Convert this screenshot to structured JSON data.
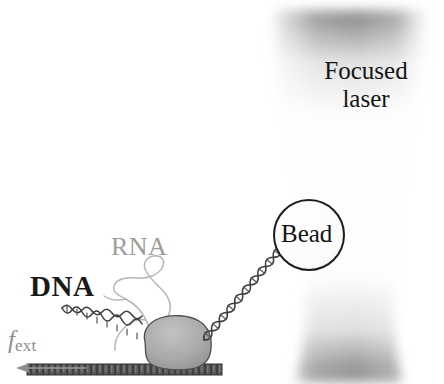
{
  "figure": {
    "width": 444,
    "height": 384,
    "background": "#ffffff"
  },
  "labels": {
    "dna": "DNA",
    "rna": "RNA",
    "bead": "Bead",
    "laser_line1": "Focused",
    "laser_line2": "laser",
    "force_symbol": "f",
    "force_subscript": "ext"
  },
  "colors": {
    "dna_label": "#1a1a1a",
    "rna_label": "#9d9d9d",
    "bead_label": "#141414",
    "laser_label": "#141414",
    "force_label": "#8e8e8e",
    "bead_fill": "#fdfdfd",
    "bead_stroke": "#1c1c1c",
    "laser_core": "#9a9a9a",
    "laser_edge": "#ffffff",
    "enzyme_fill": "#a8a8a8",
    "enzyme_stroke": "#4a4a4a",
    "surface_fill": "#555555",
    "dna_strand": "#3a3a3a",
    "rna_strand": "#b4b4b4",
    "arrow": "#9a9a9a"
  },
  "elements": {
    "laser_beam": {
      "name": "focused-laser-beam",
      "shape": "hourglass",
      "waist_y": 270,
      "top_y": 30,
      "bottom_y": 356,
      "center_x": 348
    },
    "bead": {
      "name": "trapped-bead",
      "center_x": 309,
      "center_y": 235,
      "radius": 35
    },
    "enzyme": {
      "name": "rna-polymerase-blob",
      "center_x": 176,
      "center_y": 350,
      "width": 70,
      "height": 46
    },
    "surface": {
      "name": "coverglass-surface",
      "x": 27,
      "y": 364,
      "width": 195,
      "height": 11
    },
    "tether_dna": {
      "name": "dna-tether-helix",
      "from_x": 204,
      "from_y": 340,
      "to_x": 278,
      "to_y": 252
    },
    "upstream_dna": {
      "name": "upstream-dna-helix",
      "from_x": 62,
      "from_y": 308,
      "to_x": 144,
      "to_y": 348
    },
    "rna_transcript": {
      "name": "nascent-rna-strand"
    },
    "force_arrow": {
      "name": "external-force-arrow",
      "direction": "left",
      "from_x": 86,
      "to_x": 18,
      "y": 368
    }
  }
}
